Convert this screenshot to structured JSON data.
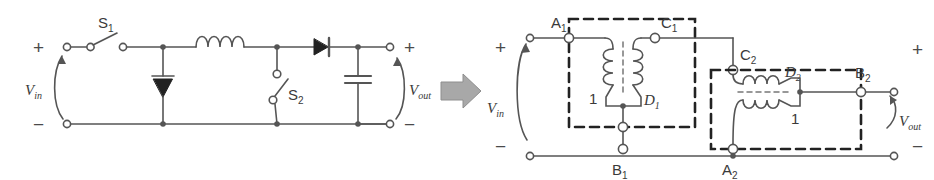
{
  "figure": {
    "type": "circuit-diagram",
    "background": "#ffffff",
    "line_color": "#555555",
    "arrow_color": "#9a9a9a"
  },
  "left_circuit": {
    "name": "switched-converter",
    "terminals": {
      "in_plus": "+",
      "in_minus": "−",
      "out_plus": "+",
      "out_minus": "−"
    },
    "source_label": "V",
    "source_sub": "in",
    "output_label": "V",
    "output_sub": "out",
    "components": [
      {
        "name": "switch-s1",
        "label": "S",
        "sub": "1",
        "kind": "switch-horizontal"
      },
      {
        "name": "diode-shunt",
        "label": "",
        "sub": "",
        "kind": "diode-down"
      },
      {
        "name": "inductor",
        "label": "",
        "sub": "",
        "kind": "inductor-4-turn"
      },
      {
        "name": "switch-s2",
        "label": "S",
        "sub": "2",
        "kind": "switch-vertical"
      },
      {
        "name": "diode-series",
        "label": "",
        "sub": "",
        "kind": "diode-right"
      },
      {
        "name": "capacitor",
        "label": "",
        "sub": "",
        "kind": "capacitor"
      }
    ]
  },
  "transform_arrow": {
    "name": "transform-arrow",
    "direction": "right"
  },
  "right_circuit": {
    "name": "coupled-inductor-equivalent",
    "terminals": {
      "in_plus": "+",
      "in_minus": "−",
      "out_plus": "+",
      "out_minus": "−"
    },
    "source_label": "V",
    "source_sub": "in",
    "output_label": "V",
    "output_sub": "out",
    "nodes": [
      {
        "name": "node-a1",
        "label": "A",
        "sub": "1",
        "marker": "open"
      },
      {
        "name": "node-c1",
        "label": "C",
        "sub": "1",
        "marker": "open"
      },
      {
        "name": "node-b1",
        "label": "B",
        "sub": "1",
        "marker": "open"
      },
      {
        "name": "node-c2",
        "label": "C",
        "sub": "2",
        "marker": "open"
      },
      {
        "name": "node-a2",
        "label": "A",
        "sub": "2",
        "marker": "filled"
      },
      {
        "name": "node-b2",
        "label": "B",
        "sub": "2",
        "marker": "open"
      }
    ],
    "cells": [
      {
        "name": "cell-d1",
        "orientation": "vertical",
        "device_label": "D",
        "device_sub": "1",
        "turns_label": "1",
        "boxed": true
      },
      {
        "name": "cell-d2",
        "orientation": "horizontal",
        "device_label": "D",
        "device_sub": "2",
        "turns_label": "1",
        "boxed": true
      }
    ]
  }
}
